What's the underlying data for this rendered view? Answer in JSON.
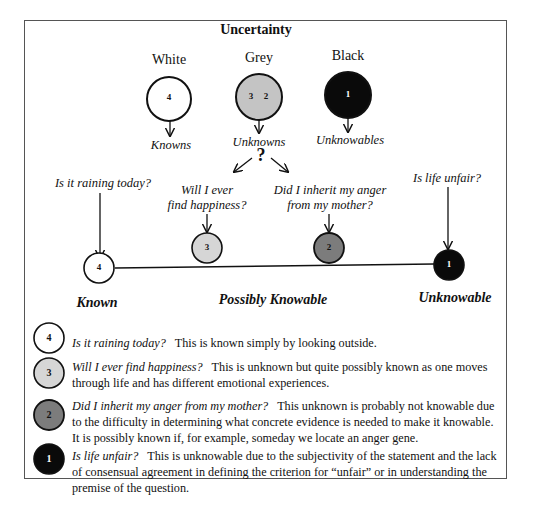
{
  "title": "Uncertainty",
  "categories": [
    {
      "key": "white",
      "label": "White",
      "circle_numbers": [
        "4"
      ],
      "fill": "#ffffff",
      "outcome": "Knowns"
    },
    {
      "key": "grey",
      "label": "Grey",
      "circle_numbers": [
        "3",
        "2"
      ],
      "fill": "#c4c4c4",
      "outcome": "Unknowns"
    },
    {
      "key": "black",
      "label": "Black",
      "circle_numbers": [
        "1"
      ],
      "fill": "#0a0a0a",
      "outcome": "Unknowables"
    }
  ],
  "question_mark": "?",
  "questions": [
    {
      "id": "4",
      "text": "Is it raining today?",
      "fill": "#ffffff",
      "text_color": "#000000"
    },
    {
      "id": "3",
      "text_line1": "Will I ever",
      "text_line2": "find happiness?",
      "fill": "#d6d6d6",
      "text_color": "#000000"
    },
    {
      "id": "2",
      "text_line1": "Did I inherit my anger",
      "text_line2": "from my mother?",
      "fill": "#7c7c7c",
      "text_color": "#000000"
    },
    {
      "id": "1",
      "text": "Is life unfair?",
      "fill": "#0a0a0a",
      "text_color": "#ffffff"
    }
  ],
  "scale_labels": {
    "left": "Known",
    "middle": "Possibly Knowable",
    "right": "Unknowable"
  },
  "legend": [
    {
      "number": "4",
      "question": "Is it raining today?",
      "explanation": "This is known simply by looking outside."
    },
    {
      "number": "3",
      "question": "Will I ever find happiness?",
      "explanation": "This is unknown but quite possibly known as one moves through life and has different emotional experiences."
    },
    {
      "number": "2",
      "question": "Did I inherit my anger from my mother?",
      "explanation": "This unknown is probably not knowable due to the difficulty in determining what concrete evidence is needed to make it knowable. It is possibly known if, for example, someday we locate an anger gene."
    },
    {
      "number": "1",
      "question": "Is life unfair?",
      "explanation": "This is unknowable due to the subjectivity of the statement and the lack of consensual agreement in defining the criterion for “unfair” or in understanding the premise of the question."
    }
  ]
}
